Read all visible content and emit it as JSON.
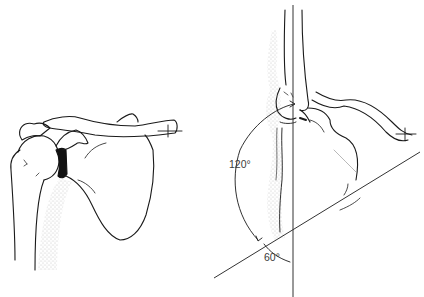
{
  "figure": {
    "left_panel": {
      "view": "anterior shoulder (glenohumeral joint, clavicle, scapula)"
    },
    "right_panel": {
      "view": "lateral arm elevation showing scapulohumeral rhythm",
      "angle_labels": {
        "glenohumeral": "120°",
        "scapulothoracic": "60°"
      }
    },
    "colors": {
      "ink": "#1a1a1a",
      "stipple": "#9a9a9a",
      "background": "#ffffff"
    }
  }
}
